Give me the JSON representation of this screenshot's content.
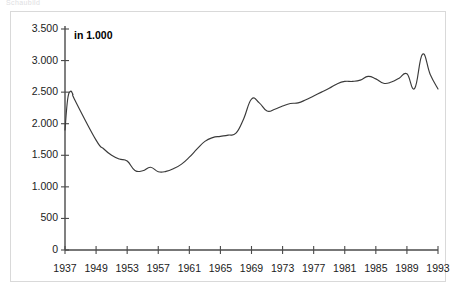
{
  "caption": {
    "clipped_text": "Schaubild"
  },
  "chart_data": {
    "type": "line",
    "title": "",
    "subtitle": "",
    "unit_note": "in 1.000",
    "xlabel": "",
    "ylabel": "",
    "xlim": [
      1937,
      1993
    ],
    "ylim": [
      0,
      3500
    ],
    "grid": false,
    "legend": null,
    "y_ticks": [
      0,
      500,
      1000,
      1500,
      2000,
      2500,
      3000,
      3500
    ],
    "y_tick_labels": [
      "0",
      "500",
      "1.000",
      "1.500",
      "2.000",
      "2.500",
      "3.000",
      "3.500"
    ],
    "x_ticks": [
      1937,
      1949,
      1953,
      1957,
      1961,
      1965,
      1969,
      1973,
      1977,
      1981,
      1985,
      1989,
      1993
    ],
    "x_tick_labels": [
      "1937",
      "1949",
      "1953",
      "1957",
      "1961",
      "1965",
      "1969",
      "1973",
      "1977",
      "1981",
      "1985",
      "1989",
      "1993"
    ],
    "x_axis_note": "Jahre 1938-1948 im Achsenmassstab zusammengefasst",
    "line_color": "#3a3a3a",
    "axis_color": "#4a4a4a",
    "series": [
      {
        "name": "Werte",
        "x": [
          1937,
          1938,
          1939,
          1940,
          1941,
          1949,
          1950,
          1951,
          1952,
          1953,
          1954,
          1955,
          1956,
          1957,
          1958,
          1959,
          1960,
          1961,
          1962,
          1963,
          1964,
          1965,
          1966,
          1967,
          1968,
          1969,
          1970,
          1971,
          1972,
          1973,
          1974,
          1975,
          1976,
          1977,
          1978,
          1979,
          1980,
          1981,
          1982,
          1983,
          1984,
          1985,
          1986,
          1987,
          1988,
          1989,
          1990,
          1991,
          1992,
          1993
        ],
        "values": [
          1900,
          2380,
          2510,
          2470,
          2360,
          1740,
          1600,
          1500,
          1440,
          1410,
          1260,
          1255,
          1310,
          1240,
          1245,
          1290,
          1360,
          1470,
          1600,
          1720,
          1780,
          1800,
          1820,
          1850,
          2080,
          2390,
          2330,
          2200,
          2230,
          2280,
          2320,
          2330,
          2380,
          2440,
          2500,
          2560,
          2630,
          2670,
          2670,
          2690,
          2750,
          2710,
          2640,
          2660,
          2720,
          2790,
          2560,
          3100,
          2780,
          2550
        ]
      }
    ]
  }
}
